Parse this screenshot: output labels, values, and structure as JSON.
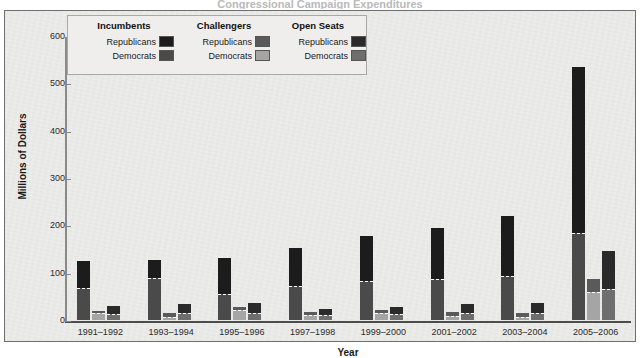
{
  "figure": {
    "title_partial": "Congressional Campaign Expenditures",
    "background_color": "#ececeb",
    "frame_color": "#6e6e6e"
  },
  "legend": {
    "groups": [
      {
        "heading": "Incumbents",
        "entries": [
          {
            "label": "Republicans",
            "color": "#1c1c1c"
          },
          {
            "label": "Democrats",
            "color": "#4a4a4a"
          }
        ]
      },
      {
        "heading": "Challengers",
        "entries": [
          {
            "label": "Republicans",
            "color": "#5a5a5a"
          },
          {
            "label": "Democrats",
            "color": "#a5a5a5"
          }
        ]
      },
      {
        "heading": "Open Seats",
        "entries": [
          {
            "label": "Republicans",
            "color": "#2a2a2a"
          },
          {
            "label": "Democrats",
            "color": "#6e6e6e"
          }
        ]
      }
    ]
  },
  "chart_data": {
    "type": "bar",
    "subtype": "grouped-stacked",
    "title": "Congressional Campaign Expenditures",
    "xlabel": "Year",
    "ylabel": "Millions of Dollars",
    "ylim": [
      0,
      600
    ],
    "yticks": [
      0,
      100,
      200,
      300,
      400,
      500,
      600
    ],
    "grid": false,
    "legend_position": "upper-left-inside",
    "categories": [
      "1991–1992",
      "1993–1994",
      "1995–1996",
      "1997–1998",
      "1999–2000",
      "2001–2002",
      "2003–2004",
      "2005–2006"
    ],
    "bar_groups": [
      {
        "name": "Incumbents",
        "republican_color": "#1c1c1c",
        "democrat_color": "#4a4a4a"
      },
      {
        "name": "Challengers",
        "republican_color": "#5a5a5a",
        "democrat_color": "#a5a5a5"
      },
      {
        "name": "Open Seats",
        "republican_color": "#2a2a2a",
        "democrat_color": "#6e6e6e"
      }
    ],
    "series": [
      {
        "name": "Incumbents – Democrats",
        "group": 0,
        "part": "dem",
        "values": [
          68,
          88,
          54,
          72,
          82,
          86,
          93,
          183
        ]
      },
      {
        "name": "Incumbents – Republicans",
        "group": 0,
        "part": "rep",
        "values": [
          57,
          38,
          78,
          81,
          96,
          108,
          127,
          351
        ]
      },
      {
        "name": "Challengers – Democrats",
        "group": 1,
        "part": "dem",
        "values": [
          14,
          7,
          22,
          10,
          14,
          9,
          7,
          60
        ]
      },
      {
        "name": "Challengers – Republicans",
        "group": 1,
        "part": "rep",
        "values": [
          6,
          8,
          6,
          6,
          7,
          9,
          8,
          26
        ]
      },
      {
        "name": "Open Seats – Democrats",
        "group": 2,
        "part": "dem",
        "values": [
          12,
          14,
          15,
          10,
          12,
          14,
          14,
          66
        ]
      },
      {
        "name": "Open Seats – Republicans",
        "group": 2,
        "part": "rep",
        "values": [
          18,
          19,
          22,
          13,
          15,
          19,
          21,
          79
        ]
      }
    ],
    "totals": {
      "incumbents": [
        125,
        126,
        132,
        153,
        178,
        194,
        220,
        534
      ],
      "challengers": [
        20,
        15,
        28,
        16,
        21,
        18,
        15,
        86
      ],
      "open_seats": [
        30,
        33,
        37,
        23,
        27,
        33,
        35,
        145
      ]
    }
  }
}
